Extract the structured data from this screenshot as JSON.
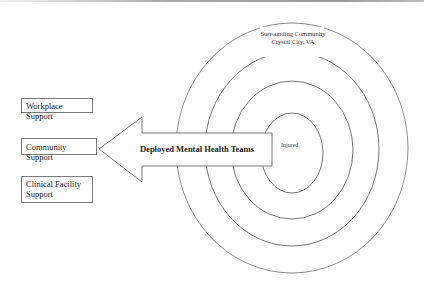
{
  "diagram": {
    "type": "concentric-circles-with-arrow",
    "rings": [
      {
        "level": 1,
        "label": "Injured"
      },
      {
        "level": 2,
        "label": ""
      },
      {
        "level": 3,
        "label": ""
      },
      {
        "level": 4,
        "label": "Surrounding Community",
        "sublabel": "Crystal City, VA"
      }
    ],
    "center_label": "Injured",
    "outer_label_line1": "Surrounding Community",
    "outer_label_line2": "Crystal City, VA",
    "arrow": {
      "label": "Deployed Mental Health Teams",
      "direction": "left"
    },
    "support_boxes": [
      {
        "label": "Workplace Support"
      },
      {
        "label": "Community Support"
      },
      {
        "label": "Clinical Facility Support",
        "line1": "Clinical Facility",
        "line2": "Support"
      }
    ],
    "colors": {
      "line": "#6e6e6e",
      "text": "#222222",
      "background": "#ffffff"
    }
  }
}
